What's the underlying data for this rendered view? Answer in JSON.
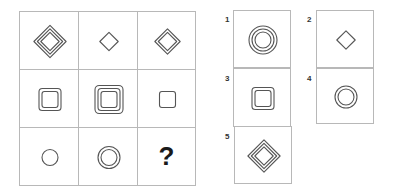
{
  "puzzle": {
    "stroke_color": "#555555",
    "grid": [
      {
        "row": 1,
        "col": 1,
        "shape": "diamond",
        "rings": 3,
        "size": "large"
      },
      {
        "row": 1,
        "col": 2,
        "shape": "diamond",
        "rings": 1,
        "size": "small"
      },
      {
        "row": 1,
        "col": 3,
        "shape": "diamond",
        "rings": 2,
        "size": "medium"
      },
      {
        "row": 2,
        "col": 1,
        "shape": "rounded-square",
        "rings": 2,
        "size": "medium"
      },
      {
        "row": 2,
        "col": 2,
        "shape": "rounded-square",
        "rings": 3,
        "size": "large"
      },
      {
        "row": 2,
        "col": 3,
        "shape": "rounded-square",
        "rings": 1,
        "size": "small"
      },
      {
        "row": 3,
        "col": 1,
        "shape": "circle",
        "rings": 1,
        "size": "small"
      },
      {
        "row": 3,
        "col": 2,
        "shape": "circle",
        "rings": 2,
        "size": "medium"
      },
      {
        "row": 3,
        "col": 3,
        "shape": "missing",
        "text": "?"
      }
    ],
    "options": [
      {
        "label": "1",
        "shape": "circle",
        "rings": 3,
        "size": "large"
      },
      {
        "label": "2",
        "shape": "diamond",
        "rings": 1,
        "size": "small"
      },
      {
        "label": "3",
        "shape": "rounded-square",
        "rings": 2,
        "size": "medium"
      },
      {
        "label": "4",
        "shape": "circle",
        "rings": 2,
        "size": "medium"
      },
      {
        "label": "5",
        "shape": "diamond",
        "rings": 3,
        "size": "large"
      }
    ]
  }
}
